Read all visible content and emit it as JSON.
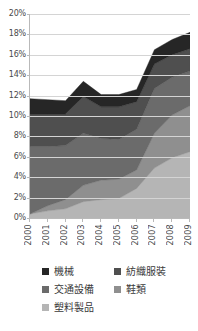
{
  "chart_data": {
    "type": "area",
    "stacked": true,
    "title": "",
    "xlabel": "",
    "ylabel": "",
    "categories": [
      "2000",
      "2001",
      "2002",
      "2003",
      "2004",
      "2005",
      "2006",
      "2007",
      "2008",
      "2009"
    ],
    "x": [
      2000,
      2001,
      2002,
      2003,
      2004,
      2005,
      2006,
      2007,
      2008,
      2009
    ],
    "ylim": [
      0,
      20
    ],
    "ytick_values": [
      0,
      2,
      4,
      6,
      8,
      10,
      12,
      14,
      16,
      18,
      20
    ],
    "ytick_labels": [
      "0%",
      "2%",
      "4%",
      "6%",
      "8%",
      "10%",
      "12%",
      "14%",
      "16%",
      "18%",
      "20%"
    ],
    "xtick_labels": [
      "2000",
      "2001",
      "2002",
      "2003",
      "2004",
      "2005",
      "2006",
      "2007",
      "2008",
      "2009"
    ],
    "yunit": "%",
    "grid": true,
    "grid_axis": "y",
    "legend_position": "bottom",
    "series_order_bottom_to_top": [
      "塑料製品",
      "鞋類",
      "交通設備",
      "紡織服裝",
      "機械"
    ],
    "series": [
      {
        "name": "機械",
        "color": "#262626",
        "stack_order": 5,
        "values": [
          1.5,
          1.4,
          1.3,
          1.5,
          1.2,
          1.2,
          1.2,
          1.4,
          1.5,
          1.6
        ]
      },
      {
        "name": "紡織服裝",
        "color": "#4f4f4f",
        "stack_order": 4,
        "values": [
          3.2,
          3.2,
          3.1,
          3.6,
          3.1,
          3.2,
          2.7,
          2.4,
          2.2,
          2.2
        ]
      },
      {
        "name": "交通設備",
        "color": "#6b6b6b",
        "stack_order": 3,
        "values": [
          6.6,
          5.8,
          5.3,
          5.1,
          4.1,
          3.9,
          4.0,
          4.4,
          3.7,
          3.4
        ]
      },
      {
        "name": "鞋類",
        "color": "#8f8f8f",
        "stack_order": 2,
        "values": [
          0.0,
          0.5,
          0.9,
          1.6,
          1.9,
          1.9,
          1.8,
          3.4,
          4.2,
          4.5
        ]
      },
      {
        "name": "塑料製品",
        "color": "#b5b5b5",
        "stack_order": 1,
        "values": [
          0.4,
          0.7,
          0.9,
          1.6,
          1.8,
          1.9,
          2.9,
          4.9,
          5.9,
          6.5
        ]
      }
    ],
    "totals": [
      11.7,
      11.6,
      11.5,
      14.6,
      13.0,
      13.2,
      12.8,
      16.5,
      17.5,
      18.2
    ],
    "annotations": []
  },
  "axis": {
    "y": {
      "ticks": [
        {
          "label": "20%",
          "value": 20
        },
        {
          "label": "18%",
          "value": 18
        },
        {
          "label": "16%",
          "value": 16
        },
        {
          "label": "14%",
          "value": 14
        },
        {
          "label": "12%",
          "value": 12
        },
        {
          "label": "10%",
          "value": 10
        },
        {
          "label": "8%",
          "value": 8
        },
        {
          "label": "6%",
          "value": 6
        },
        {
          "label": "4%",
          "value": 4
        },
        {
          "label": "2%",
          "value": 2
        },
        {
          "label": "0%",
          "value": 0
        }
      ]
    },
    "x": {
      "ticks": [
        {
          "label": "2000"
        },
        {
          "label": "2001"
        },
        {
          "label": "2002"
        },
        {
          "label": "2003"
        },
        {
          "label": "2004"
        },
        {
          "label": "2005"
        },
        {
          "label": "2006"
        },
        {
          "label": "2007"
        },
        {
          "label": "2008"
        },
        {
          "label": "2009"
        }
      ]
    }
  },
  "legend": {
    "entries": [
      {
        "label": "機械",
        "color": "#262626"
      },
      {
        "label": "紡織服裝",
        "color": "#4f4f4f"
      },
      {
        "label": "交通設備",
        "color": "#6b6b6b"
      },
      {
        "label": "鞋類",
        "color": "#8f8f8f"
      },
      {
        "label": "塑料製品",
        "color": "#b5b5b5"
      }
    ]
  },
  "style": {
    "plot_background": "#ffffff",
    "grid_color": "#d4d4d4",
    "axis_color": "#b9b9b9",
    "text_color": "#3a3a3a"
  }
}
